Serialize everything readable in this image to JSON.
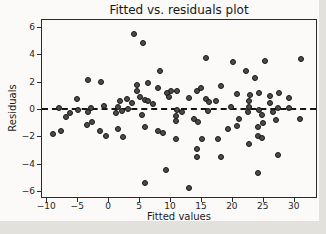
{
  "figure": {
    "background": "#fbfaf8",
    "page_background": "#e3e1dc"
  },
  "chart_data": {
    "type": "scatter",
    "title": "Fitted vs. residuals plot",
    "xlabel": "Fitted values",
    "ylabel": "Residuals",
    "xlim": [
      -10.7,
      33.6
    ],
    "ylim": [
      -6.44,
      6.51
    ],
    "xtick_values": [
      -10,
      -5,
      0,
      5,
      10,
      15,
      20,
      25,
      30
    ],
    "xtick_labels": [
      "−10",
      "−5",
      "0",
      "5",
      "10",
      "15",
      "20",
      "25",
      "30"
    ],
    "ytick_values": [
      -6,
      -4,
      -2,
      0,
      2,
      4,
      6
    ],
    "ytick_labels": [
      "−6",
      "−4",
      "−2",
      "0",
      "2",
      "4",
      "6"
    ],
    "grid": false,
    "legend": "none",
    "reference_line": {
      "y": 0,
      "style": "dashed",
      "color": "#141414"
    },
    "marker": {
      "shape": "circle",
      "fill": "#4b4b4b",
      "edge": "#161616",
      "diameter_px": 6
    },
    "points": [
      [
        4.2,
        5.5
      ],
      [
        5.7,
        4.8
      ],
      [
        15.8,
        3.7
      ],
      [
        31.2,
        3.65
      ],
      [
        25.4,
        3.5
      ],
      [
        20.1,
        3.45
      ],
      [
        22.3,
        2.8
      ],
      [
        8.4,
        2.75
      ],
      [
        23.8,
        2.3
      ],
      [
        -3.2,
        2.1
      ],
      [
        -1.2,
        2.0
      ],
      [
        6.5,
        1.9
      ],
      [
        4.6,
        1.77
      ],
      [
        18.2,
        1.65
      ],
      [
        8.1,
        1.55
      ],
      [
        15.0,
        1.55
      ],
      [
        10.2,
        1.35
      ],
      [
        11.1,
        1.35
      ],
      [
        14.3,
        1.35
      ],
      [
        4.6,
        1.28
      ],
      [
        9.5,
        1.2
      ],
      [
        24.4,
        1.15
      ],
      [
        27.6,
        1.15
      ],
      [
        20.9,
        1.1
      ],
      [
        23.0,
        1.05
      ],
      [
        26.1,
        0.95
      ],
      [
        9.9,
        0.9
      ],
      [
        13.0,
        0.8
      ],
      [
        5.2,
        0.85
      ],
      [
        29.2,
        0.8
      ],
      [
        -5.1,
        0.7
      ],
      [
        15.8,
        0.7
      ],
      [
        3.0,
        0.7
      ],
      [
        5.9,
        0.65
      ],
      [
        22.7,
        0.6
      ],
      [
        1.9,
        0.55
      ],
      [
        6.5,
        0.55
      ],
      [
        17.5,
        0.55
      ],
      [
        16.3,
        0.5
      ],
      [
        26.2,
        0.45
      ],
      [
        3.9,
        0.45
      ],
      [
        7.3,
        0.4
      ],
      [
        -0.7,
        0.25
      ],
      [
        19.8,
        0.15
      ],
      [
        22.8,
        0.15
      ],
      [
        1.6,
        0.14
      ],
      [
        -7.9,
        0.1
      ],
      [
        29.3,
        0.1
      ],
      [
        -2.7,
        0.1
      ],
      [
        27.4,
        0.07
      ],
      [
        3.2,
        0.0
      ],
      [
        -4.9,
        -0.1
      ],
      [
        24.4,
        -0.1
      ],
      [
        11.2,
        -0.1
      ],
      [
        2.2,
        -0.13
      ],
      [
        16.1,
        -0.15
      ],
      [
        12.0,
        -0.2
      ],
      [
        -3.2,
        -0.2
      ],
      [
        26.6,
        -0.2
      ],
      [
        22.6,
        -0.25
      ],
      [
        -6.1,
        -0.3
      ],
      [
        1.2,
        -0.3
      ],
      [
        5.5,
        -0.45
      ],
      [
        24.8,
        -0.45
      ],
      [
        11.0,
        -0.5
      ],
      [
        -6.8,
        -0.6
      ],
      [
        31.0,
        -0.7
      ],
      [
        21.2,
        -0.73
      ],
      [
        13.9,
        -0.73
      ],
      [
        27.1,
        -0.79
      ],
      [
        10.9,
        -0.9
      ],
      [
        14.6,
        -0.92
      ],
      [
        -2.6,
        -0.95
      ],
      [
        25.1,
        -1.0
      ],
      [
        -3.5,
        -1.15
      ],
      [
        20.9,
        -1.23
      ],
      [
        5.9,
        -1.35
      ],
      [
        24.2,
        -1.35
      ],
      [
        1.6,
        -1.47
      ],
      [
        19.3,
        -1.47
      ],
      [
        -1.4,
        -1.6
      ],
      [
        -7.6,
        -1.6
      ],
      [
        8.0,
        -1.6
      ],
      [
        8.8,
        -1.75
      ],
      [
        -8.9,
        -1.8
      ],
      [
        -0.3,
        -1.96
      ],
      [
        24.3,
        -2.0
      ],
      [
        2.4,
        -2.08
      ],
      [
        24.9,
        -2.15
      ],
      [
        15.1,
        -2.2
      ],
      [
        11.0,
        -2.2
      ],
      [
        17.8,
        -2.2
      ],
      [
        22.7,
        -2.56
      ],
      [
        14.4,
        -2.9
      ],
      [
        27.4,
        -3.4
      ],
      [
        14.3,
        -3.54
      ],
      [
        18.2,
        -3.54
      ],
      [
        9.4,
        -4.5
      ],
      [
        24.2,
        -4.65
      ],
      [
        5.9,
        -5.4
      ],
      [
        13.1,
        -5.75
      ]
    ]
  }
}
